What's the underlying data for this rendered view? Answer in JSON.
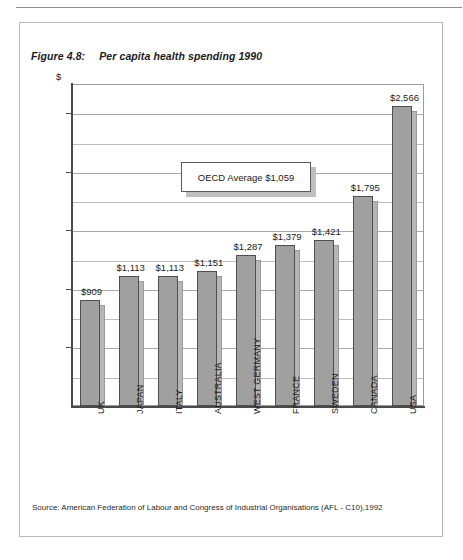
{
  "figure": {
    "number": "Figure 4.8:",
    "title": "Per capita health spending 1990",
    "source": "Source: American Federation of Labour and Congress of Industrial Organisations (AFL - C10),1992",
    "currency_symbol": "$"
  },
  "callout": {
    "text": "OECD Average $1,059",
    "value": 1059
  },
  "chart_data": {
    "type": "bar",
    "title": "Per capita health spending 1990",
    "xlabel": "",
    "ylabel": "$",
    "ylim": [
      0,
      2750
    ],
    "yticks": [
      0,
      500,
      1000,
      1500,
      2000,
      2500
    ],
    "ytick_labels": [
      "0",
      "500",
      "1,000",
      "1,500",
      "2,000",
      "2,500"
    ],
    "minor_gridline_step": 250,
    "grid": true,
    "legend": "none",
    "categories": [
      "UK",
      "JAPAN",
      "ITALY",
      "AUSTRALIA",
      "WEST GERMANY",
      "FRANCE",
      "SWEDEN",
      "CANADA",
      "USA"
    ],
    "values": [
      909,
      1113,
      1113,
      1151,
      1287,
      1379,
      1421,
      1795,
      2566
    ],
    "data_labels": [
      "$909",
      "$1,113",
      "$1,113",
      "$1,151",
      "$1,287",
      "$1,379",
      "$1,421",
      "$1,795",
      "$2,566"
    ],
    "annotations": [
      "OECD Average $1,059"
    ],
    "bar_color": "#a0a0a0",
    "bar_edge_color": "#4f4f4f",
    "shadow_color": "#b6b6b6"
  }
}
